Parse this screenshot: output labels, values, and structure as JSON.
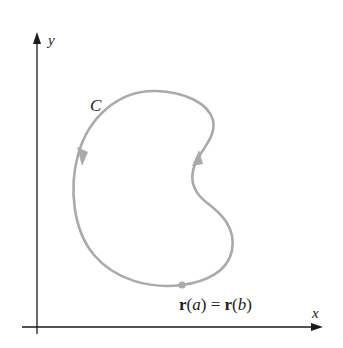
{
  "figure": {
    "axes": {
      "x_label": "x",
      "y_label": "y",
      "axis_color": "#1a1a1a"
    },
    "curve": {
      "label": "C",
      "color": "#aaaaaa",
      "closed": true,
      "orientation": "counterclockwise",
      "point_label_parts": {
        "r1": "r",
        "open1": "(",
        "a": "a",
        "close1": ")",
        "eq": " = ",
        "r2": "r",
        "open2": "(",
        "b": "b",
        "close2": ")"
      },
      "point_label": "r(a) = r(b)"
    }
  }
}
